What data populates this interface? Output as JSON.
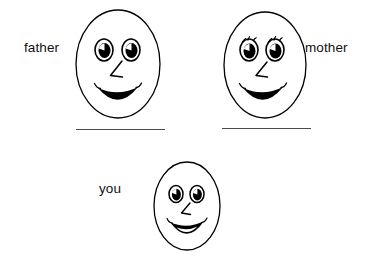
{
  "page": {
    "background_color": "#ffffff",
    "ink_color": "#000000",
    "rule_color": "#4a4a4a"
  },
  "labels": {
    "father": "father",
    "mother": "mother",
    "you": "you"
  },
  "figures": [
    {
      "id": "father",
      "name": "father-face",
      "icon": "smiley-face-icon",
      "eyes": "round-eyes-with-highlight",
      "has_eyelashes": false,
      "nose": "angular-v-nose",
      "mouth": "filled-crescent-smile",
      "has_answer_line": true
    },
    {
      "id": "mother",
      "name": "mother-face",
      "icon": "smiley-face-icon",
      "eyes": "round-eyes-with-highlight",
      "has_eyelashes": true,
      "nose": "angular-v-nose",
      "mouth": "filled-crescent-smile",
      "has_answer_line": true
    },
    {
      "id": "you",
      "name": "you-face",
      "icon": "smiley-face-icon",
      "eyes": "round-eyes-with-highlight",
      "has_eyelashes": false,
      "nose": "angular-v-nose",
      "mouth": "open-smile-with-teeth",
      "has_answer_line": false
    }
  ]
}
